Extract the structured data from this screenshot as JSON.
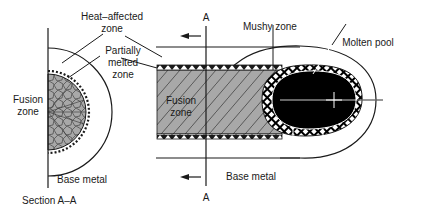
{
  "diagram": {
    "type": "weld zone schematic",
    "labels": {
      "heat_affected_zone": [
        "Heat–affected",
        "zone"
      ],
      "partially_melted_zone": [
        "Partially",
        "melted",
        "zone"
      ],
      "fusion_zone_section": [
        "Fusion",
        "zone"
      ],
      "base_metal_section": "Base metal",
      "section_caption": "Section A–A",
      "section_marker_top": "A",
      "section_marker_bottom": "A",
      "mushy_zone": "Mushy zone",
      "molten_pool": "Molten pool",
      "fusion_zone_top": [
        "Fusion",
        "zone"
      ],
      "base_metal_top": "Base metal"
    },
    "colors": {
      "line": "#1a1a1a",
      "fusion_zone_fill": "#a8a8a8",
      "molten_pool_fill": "#000000",
      "background": "#ffffff"
    },
    "arrows": [
      {
        "name": "travel-direction-arrow-top",
        "direction": "left"
      },
      {
        "name": "travel-direction-arrow-bottom",
        "direction": "left"
      }
    ]
  }
}
